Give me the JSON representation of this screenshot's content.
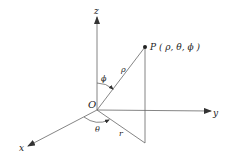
{
  "diagram": {
    "point_label": "P ( ρ, θ, ϕ )",
    "origin_label": "O",
    "axes": {
      "x": "x",
      "y": "y",
      "z": "z"
    },
    "segment_labels": {
      "rho": "ρ",
      "r": "r"
    },
    "angle_labels": {
      "phi": "ϕ",
      "theta": "θ"
    },
    "colors": {
      "line": "#555555",
      "text": "#222222",
      "background": "#ffffff"
    }
  }
}
